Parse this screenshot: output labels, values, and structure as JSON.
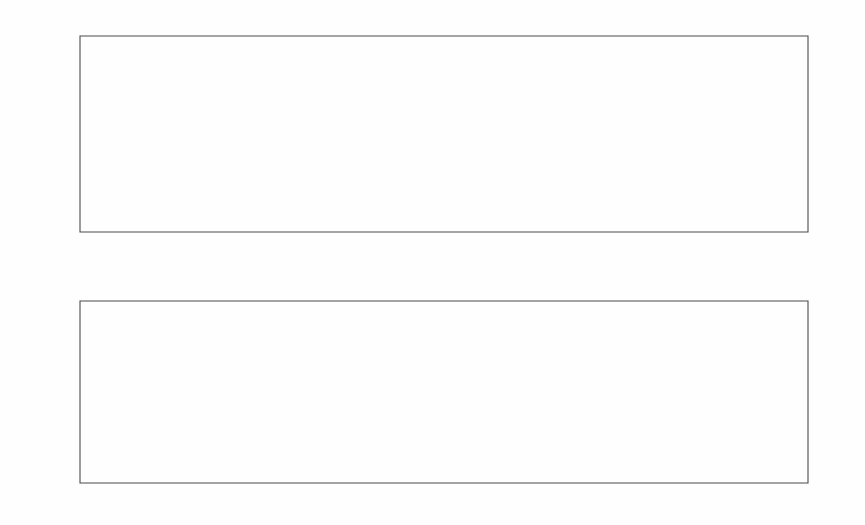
{
  "figure": {
    "background_color": "#fefefe",
    "line_color": "#2b2b2b",
    "axis_color": "#4a4a4a",
    "threshold_color": "#bdbdbd"
  },
  "chart_data": [
    {
      "type": "line",
      "panel": "top",
      "title": "",
      "xlabel": "",
      "ylabel": "",
      "xlim": [
        0,
        160
      ],
      "ylim": [
        -10,
        10
      ],
      "xticks": [
        0,
        20,
        40,
        60,
        80,
        100,
        120,
        140,
        160
      ],
      "yticks": [
        -10,
        -5,
        0,
        5,
        10
      ],
      "grid": false,
      "legend": "none",
      "linestyle": "solid",
      "x": [
        1,
        2,
        3,
        4,
        5,
        6,
        7,
        8,
        9,
        10,
        11,
        12,
        13,
        14,
        15,
        16,
        17,
        18,
        19,
        20,
        21,
        22,
        23,
        24,
        25,
        26,
        27,
        28,
        29,
        30,
        31,
        32,
        33,
        34,
        35,
        36,
        37,
        38,
        39,
        40,
        41,
        42,
        43,
        44,
        45,
        46,
        47,
        48,
        49,
        50,
        51,
        52,
        53,
        54,
        55,
        56,
        57,
        58,
        59,
        60,
        61,
        62,
        63,
        64,
        65,
        66,
        67,
        68,
        69,
        70,
        71,
        72,
        73,
        74,
        75,
        76,
        77,
        78,
        79,
        80,
        81,
        82,
        83,
        84,
        85,
        86,
        87,
        88,
        89,
        90,
        91,
        92,
        93,
        94,
        95,
        96,
        97,
        98,
        99,
        100,
        101,
        102,
        103,
        104,
        105,
        106,
        107,
        108,
        109,
        110,
        111,
        112,
        113,
        114,
        115,
        116,
        117,
        118,
        119,
        120,
        121,
        122,
        123,
        124,
        125,
        126,
        127,
        128,
        129,
        130,
        131,
        132,
        133,
        134,
        135,
        136,
        137,
        138,
        139,
        140,
        141,
        142,
        143,
        144,
        145,
        146,
        147,
        148,
        149,
        150,
        151,
        152,
        153,
        154,
        155,
        156,
        157,
        158,
        159,
        160
      ],
      "values": [
        0.6,
        0.9,
        0.3,
        -0.2,
        -1.2,
        0.5,
        1.6,
        0.3,
        -1.0,
        -0.6,
        0.8,
        1.5,
        0.4,
        -0.8,
        -1.4,
        0.2,
        1.3,
        2.4,
        0.1,
        -1.4,
        -0.9,
        0.7,
        1.5,
        0.5,
        -0.7,
        -1.6,
        0.4,
        1.6,
        0.6,
        -0.9,
        -1.5,
        0.5,
        2.0,
        0.6,
        -1.0,
        -1.7,
        0.3,
        1.7,
        0.8,
        -0.7,
        -1.3,
        0.4,
        1.4,
        0.3,
        -1.2,
        -1.0,
        0.2,
        0.9,
        1.1,
        0.2,
        -0.4,
        0.5,
        1.2,
        0.4,
        -0.5,
        -0.8,
        0.6,
        1.3,
        0.1,
        6.0,
        -1.5,
        5.3,
        -1.0,
        4.8,
        -0.6,
        1.3,
        1.5,
        0.0,
        -1.1,
        -0.6,
        0.5,
        1.6,
        0.4,
        -1.0,
        -1.5,
        0.3,
        1.8,
        0.6,
        -1.1,
        -1.9,
        0.4,
        1.5,
        0.5,
        -0.9,
        -1.2,
        0.6,
        2.0,
        0.5,
        -1.0,
        -1.4,
        0.3,
        1.6,
        0.7,
        -0.8,
        -1.5,
        0.5,
        1.4,
        0.3,
        -1.0,
        -7.0,
        6.3,
        -0.7,
        1.1,
        1.6,
        0.3,
        -1.2,
        -1.5,
        0.6,
        2.2,
        0.5,
        -0.9,
        -1.3,
        0.4,
        1.5,
        0.7,
        -0.8,
        -1.4,
        0.3,
        1.6,
        0.4,
        -0.9,
        -1.1,
        0.5,
        1.3,
        0.6,
        -0.7,
        -2.0,
        0.4,
        1.8,
        0.5,
        -1.0,
        -1.3,
        0.3,
        1.5,
        0.7,
        -0.9,
        -1.6,
        0.4,
        1.4,
        0.5,
        -0.8,
        -1.3,
        0.6,
        1.9,
        0.4,
        -1.0,
        -1.4,
        0.3,
        1.6,
        0.5,
        -0.9,
        -1.2,
        0.4,
        1.5,
        0.6,
        -0.8,
        -1.0,
        0.3,
        0.9,
        0.4
      ],
      "markers": {
        "style": "open-circle",
        "points": [
          {
            "x": 60,
            "y": 6.0
          },
          {
            "x": 62,
            "y": 5.3
          },
          {
            "x": 64,
            "y": 4.8
          },
          {
            "x": 100,
            "y": -7.0
          },
          {
            "x": 101,
            "y": 6.3
          }
        ]
      },
      "annotations": []
    },
    {
      "type": "line",
      "panel": "bottom",
      "title": "",
      "xlabel": "",
      "ylabel": "",
      "xlim": [
        0,
        160
      ],
      "ylim": [
        -4,
        4
      ],
      "xticks": [
        0,
        20,
        40,
        60,
        80,
        100,
        120,
        140,
        160
      ],
      "yticks": [
        -4,
        -2,
        0,
        2,
        4
      ],
      "grid": false,
      "legend": "none",
      "linestyle": "dotted",
      "threshold_lines": [
        {
          "value": 2.6,
          "style": "dashed",
          "color": "#b9b9b9"
        },
        {
          "value": -2.6,
          "style": "dotted",
          "color": "#c2c2c2"
        }
      ],
      "x": [
        1,
        2,
        3,
        4,
        5,
        6,
        7,
        8,
        9,
        10,
        11,
        12,
        13,
        14,
        15,
        16,
        17,
        18,
        19,
        20,
        21,
        22,
        23,
        24,
        25,
        26,
        27,
        28,
        29,
        30,
        31,
        32,
        33,
        34,
        35,
        36,
        37,
        38,
        39,
        40,
        41,
        42,
        43,
        44,
        45,
        46,
        47,
        48,
        49,
        50,
        51,
        52,
        53,
        54,
        55,
        56,
        57,
        58,
        59,
        60,
        61,
        62,
        63,
        64,
        65,
        66,
        67,
        68,
        69,
        70,
        71,
        72,
        73,
        74,
        75,
        76,
        77,
        78,
        79,
        80,
        81,
        82,
        83,
        84,
        85,
        86,
        87,
        88,
        89,
        90,
        91,
        92,
        93,
        94,
        95,
        96,
        97,
        98,
        99,
        100,
        101,
        102,
        103,
        104,
        105,
        106,
        107,
        108,
        109,
        110,
        111,
        112,
        113,
        114,
        115,
        116,
        117,
        118,
        119,
        120,
        121,
        122,
        123,
        124,
        125,
        126,
        127,
        128,
        129,
        130,
        131,
        132,
        133,
        134,
        135,
        136,
        137,
        138,
        139,
        140,
        141,
        142,
        143,
        144,
        145,
        146,
        147,
        148,
        149,
        150,
        151,
        152,
        153,
        154,
        155,
        156,
        157,
        158,
        159,
        160
      ],
      "values": [
        0.0,
        0.0,
        0.0,
        -0.2,
        -1.8,
        -1.9,
        -0.9,
        0.1,
        0.7,
        0.8,
        0.75,
        0.4,
        0.1,
        -0.6,
        -0.3,
        -0.75,
        -0.4,
        0.15,
        0.9,
        1.05,
        0.1,
        -0.75,
        -2.15,
        -1.2,
        -0.4,
        0.1,
        0.45,
        0.1,
        -0.5,
        -0.35,
        0.35,
        0.9,
        1.35,
        0.9,
        0.35,
        -0.1,
        -0.55,
        -1.7,
        -0.95,
        -0.2,
        0.2,
        0.6,
        0.95,
        0.5,
        0.1,
        0.65,
        1.1,
        0.6,
        0.2,
        -0.35,
        -0.55,
        -1.15,
        -0.85,
        -0.45,
        -0.9,
        -0.8,
        -0.5,
        0.7,
        1.9,
        2.6,
        2.35,
        2.6,
        2.3,
        2.6,
        1.45,
        -0.55,
        -0.5,
        0.2,
        1.05,
        0.45,
        -0.15,
        0.0,
        -0.3,
        -0.9,
        -0.35,
        0.25,
        0.75,
        0.55,
        0.9,
        0.5,
        0.05,
        -0.55,
        -0.9,
        -0.25,
        0.3,
        0.85,
        1.35,
        0.5,
        0.35,
        0.8,
        0.55,
        -0.15,
        -0.8,
        -0.6,
        0.2,
        0.85,
        1.0,
        0.45,
        -1.5,
        -4.0,
        4.0,
        1.3,
        -0.4,
        -1.1,
        -0.65,
        0.35,
        1.2,
        0.6,
        -0.1,
        -0.65,
        -0.9,
        -0.45,
        -0.1,
        0.3,
        0.75,
        0.45,
        0.0,
        -0.4,
        -0.65,
        0.2,
        0.8,
        0.5,
        0.1,
        -0.45,
        -0.85,
        0.3,
        1.25,
        1.9,
        1.05,
        0.3,
        -0.25,
        -0.5,
        -1.35,
        -0.75,
        -0.2,
        0.45,
        1.2,
        1.45,
        0.6,
        -0.2,
        -0.6,
        -0.95,
        -1.9,
        -1.1,
        -0.4,
        0.15,
        0.55,
        0.3,
        -0.2,
        -0.45,
        0.0,
        0.45,
        0.15,
        -0.3,
        -0.8,
        -0.4,
        0.0,
        0.0
      ],
      "annotations": []
    }
  ]
}
